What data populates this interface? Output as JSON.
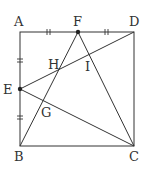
{
  "diagram": {
    "type": "geometry",
    "shape": "square ABCD",
    "points": {
      "A": {
        "label": "A",
        "x": 20,
        "y": 32,
        "lx": 14,
        "ly": 26
      },
      "B": {
        "label": "B",
        "x": 20,
        "y": 146,
        "lx": 14,
        "ly": 161
      },
      "C": {
        "label": "C",
        "x": 134,
        "y": 146,
        "lx": 129,
        "ly": 161
      },
      "D": {
        "label": "D",
        "x": 134,
        "y": 32,
        "lx": 129,
        "ly": 26
      },
      "E": {
        "label": "E",
        "x": 20,
        "y": 89,
        "lx": 3,
        "ly": 94
      },
      "F": {
        "label": "F",
        "x": 78,
        "y": 32,
        "lx": 73,
        "ly": 26
      },
      "H": {
        "label": "H",
        "x": 58,
        "y": 70,
        "lx": 48,
        "ly": 69
      },
      "I": {
        "label": "I",
        "x": 89,
        "y": 60,
        "lx": 85,
        "ly": 71
      },
      "G": {
        "label": "G",
        "x": 43,
        "y": 102,
        "lx": 41,
        "ly": 117
      }
    },
    "segments": [
      "AB",
      "BC",
      "CD",
      "DA",
      "ED",
      "EC",
      "FB",
      "FC"
    ],
    "equal_marks": [
      "AF = FD (double tick)",
      "AE = EB (double tick)"
    ],
    "colors": {
      "stroke": "#333333",
      "text": "#333333",
      "point": "#222222"
    }
  }
}
